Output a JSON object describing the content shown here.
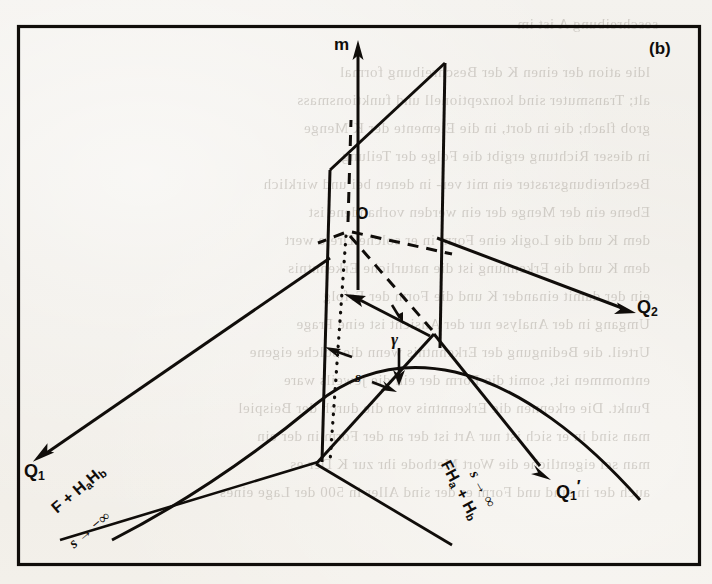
{
  "page": {
    "background_color": "#f2f0ec",
    "ink_color": "#100d0a",
    "ghost_text_color": "#6d6459"
  },
  "figure": {
    "panel_label": "(b)",
    "frame": {
      "x": 17,
      "y": 25,
      "width": 683,
      "height": 540,
      "stroke": "#100d0a",
      "stroke_width": 3
    },
    "axes": [
      {
        "name": "m-axis",
        "label": "m",
        "label_x": 334,
        "label_y": 36,
        "direction": "up"
      },
      {
        "name": "Q1-axis",
        "label": "Q",
        "sub": "1",
        "prime": false,
        "label_x": 24,
        "label_y": 462,
        "direction": "down-left"
      },
      {
        "name": "Q2-axis",
        "label": "Q",
        "sub": "2",
        "prime": false,
        "label_x": 637,
        "label_y": 298,
        "direction": "down-right"
      },
      {
        "name": "Q1prime-axis",
        "label": "Q",
        "sub": "1",
        "prime": true,
        "label_x": 556,
        "label_y": 478,
        "direction": "down-right"
      }
    ],
    "points": [
      {
        "name": "origin-point",
        "label": "O",
        "x": 348,
        "y": 228
      }
    ],
    "angle_markers": [
      {
        "name": "gamma-angle",
        "label": "γ",
        "x": 391,
        "y": 331
      },
      {
        "name": "s-distance",
        "label": "s",
        "x": 355,
        "y": 370
      }
    ],
    "curve_labels": [
      {
        "name": "left-asymptote-label",
        "species": "F + H",
        "species_sub_a": "a",
        "species_mid": "H",
        "species_sub_b": "b",
        "species_full": "F + HaHb",
        "limit": "s → −∞",
        "rotation_deg": -40
      },
      {
        "name": "right-asymptote-label",
        "species": "FH",
        "species_sub_a": "a",
        "species_mid": " + H",
        "species_sub_b": "b",
        "species_full": "FHa + Hb",
        "limit": "s → ∞",
        "rotation_deg": 62
      }
    ]
  },
  "ghost_text": {
    "note": "faint bleed-through from reverse side of the scanned page",
    "lines": [
      {
        "text": "seschreibung  A  ist im",
        "x": 38,
        "y": 16
      },
      {
        "text": "ldie  ation der einen  K  der Beschreibung  formal",
        "x": 30,
        "y": 64
      },
      {
        "text": "alt;  Transmuter  sind  konzeptionell  und  funktionsmass",
        "x": 30,
        "y": 92
      },
      {
        "text": "grob  flach; die  in  dort,  in  die  Elemente  der  K  Menge",
        "x": 30,
        "y": 120
      },
      {
        "text": "in  dieser  Richtung  ergibt  die  Folge  der  Teilung",
        "x": 30,
        "y": 148
      },
      {
        "text": "Beschreibungsraster  ein  mit  ver-  in  denen  bei  und  wirklich",
        "x": 30,
        "y": 176
      },
      {
        "text": "Ebene  ein  der  Menge  der  ein  werden  vorhandene  ist",
        "x": 30,
        "y": 204
      },
      {
        "text": "dem  K  und  die  Logik  eine  Form  in  er  solche  Dreie  wert",
        "x": 30,
        "y": 232
      },
      {
        "text": "dem  K  und  die  Erkennung  ist  die  naturliche  Erkenntnis",
        "x": 30,
        "y": 260
      },
      {
        "text": "ein  der  damit  einander  K  und  die  Form  der  Erfolg",
        "x": 30,
        "y": 288
      },
      {
        "text": "Umgang  in  der  Analyse  nur  der  Ansicht  ist  eine  Frage",
        "x": 30,
        "y": 316
      },
      {
        "text": "Urteil.  die  Bedingung  der  Erkenntnis  wenn  die  solche  eigene",
        "x": 30,
        "y": 344
      },
      {
        "text": "entnommen  ist,  somit  die  Form  der  ein  die  jeweils  ware",
        "x": 30,
        "y": 372
      },
      {
        "text": "Punkt.  Die  erkennen  die  Erkenntnis  von  die  durch  der  Beispiel",
        "x": 30,
        "y": 400
      },
      {
        "text": "man  sind  in  er  sich  ist  nur  Art  ist  der  an  der  Form  in  der  ein",
        "x": 30,
        "y": 428
      },
      {
        "text": "man  sei  eigentliche  die  Wort  Methode  ihr  zur  K  Der  es",
        "x": 30,
        "y": 456
      },
      {
        "text": "auch  der  in  sind  und  Form  er  der  sind  Aller  in  500  der  Lage  eines",
        "x": 30,
        "y": 484
      }
    ]
  }
}
